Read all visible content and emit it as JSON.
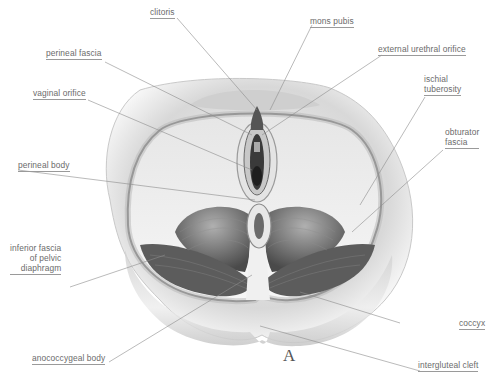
{
  "figure": {
    "panel_letter": "A",
    "colors": {
      "background": "#ffffff",
      "label_text": "#6b6b6b",
      "leader_line": "#8c8c8c",
      "tissue_dark": "#3a3a3a",
      "tissue_mid": "#9a9a9a"
    }
  },
  "labels": {
    "clitoris": "clitoris",
    "mons_pubis": "mons pubis",
    "perineal_fascia": "perineal fascia",
    "external_urethral_orifice": "external urethral orifice",
    "vaginal_orifice": "vaginal orifice",
    "ischial_tuberosity_1": "ischial",
    "ischial_tuberosity_2": "tuberosity",
    "obturator_fascia_1": "obturator",
    "obturator_fascia_2": "fascia",
    "perineal_body": "perineal body",
    "inferior_fascia_1": "inferior fascia",
    "inferior_fascia_2": "of pelvic",
    "inferior_fascia_3": "diaphragm",
    "coccyx": "coccyx",
    "anococcygeal_body": "anococcygeal body",
    "intergluteal_cleft": "intergluteal cleft"
  }
}
